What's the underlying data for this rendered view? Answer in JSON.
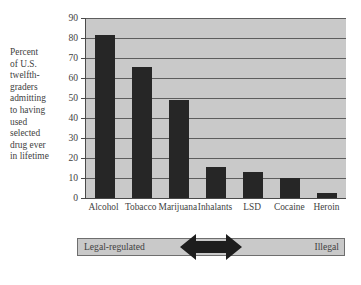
{
  "chart_data": {
    "type": "bar",
    "title": "",
    "subtitle": "",
    "xlabel": "",
    "ylabel": "Percent of U.S. twelfth-graders admitting to having used selected drug ever in lifetime",
    "categories": [
      "Alcohol",
      "Tobacco",
      "Marijuana",
      "Inhalants",
      "LSD",
      "Cocaine",
      "Heroin"
    ],
    "values": [
      81.5,
      65.5,
      49,
      15.5,
      13,
      10,
      2.5
    ],
    "ylim": [
      0,
      90
    ],
    "ytick_labels": [
      "0",
      "10",
      "20",
      "30",
      "40",
      "50",
      "60",
      "70",
      "80",
      "90"
    ],
    "ytick_values": [
      0,
      10,
      20,
      30,
      40,
      50,
      60,
      70,
      80,
      90
    ],
    "grid": true,
    "legend_position": "none",
    "bar_color": "#262626",
    "plot_background": "#c9c9c9",
    "axis_color": "#4a4a4a",
    "gridline_color": "#5d5d5d",
    "text_color": "#3f3f3f",
    "annotations": {
      "band_left_label": "Legal-regulated",
      "band_right_label": "Illegal",
      "band_arrow": "double-headed-arrow"
    }
  },
  "ylabel_text": "Percent\nof U.S.\ntwelfth-\ngraders\nadmitting\nto having\nused\nselected\ndrug ever\nin lifetime",
  "band": {
    "left_label": "Legal-regulated",
    "right_label": "Illegal"
  }
}
